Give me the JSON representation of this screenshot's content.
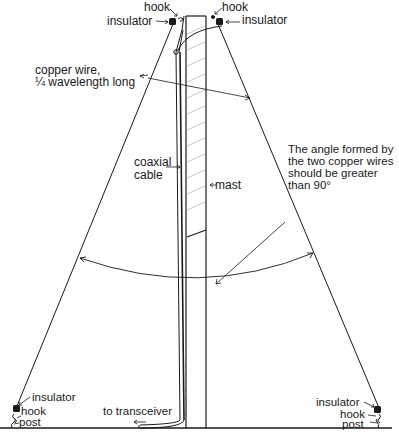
{
  "diagram": {
    "type": "inverted-V dipole antenna on mast",
    "colors": {
      "ink": "#1a1a1a",
      "hatch": "#bdbdbd",
      "background": "#ffffff"
    },
    "labels": {
      "hook_top_left": "hook",
      "insulator_top_left": "insulator",
      "hook_top_right": "hook",
      "insulator_top_right": "insulator",
      "copper_wire_line1": "copper wire,",
      "copper_wire_line2": "¼ wavelength long",
      "angle_note": "The angle formed by\nthe two copper wires\nshould be greater\nthan 90°",
      "coaxial_cable": "coaxial\ncable",
      "mast": "mast",
      "insulator_bottom_left": "insulator",
      "hook_bottom_left": "hook",
      "post_bottom_left": "post",
      "to_transceiver": "to transceiver",
      "insulator_bottom_right": "insulator",
      "hook_bottom_right": "hook",
      "post_bottom_right": "post"
    },
    "components": [
      "mast",
      "coaxial cable",
      "copper wire (left)",
      "copper wire (right)",
      "insulators",
      "hooks",
      "posts",
      "angle arc"
    ]
  }
}
